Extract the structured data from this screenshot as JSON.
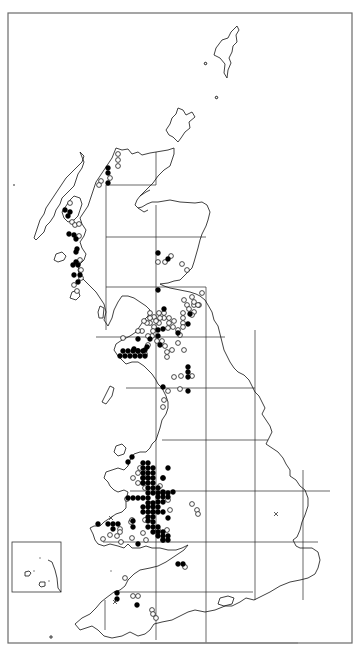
{
  "map": {
    "title": "",
    "region": "Great Britain distribution map",
    "legend": {
      "filled_circle": "record (recent)",
      "open_circle": "record (older)",
      "cross": "introduced / uncertain"
    },
    "colors": {
      "marker": "#000000",
      "background": "#ffffff",
      "frame": "#6a6a6a"
    },
    "grid_unit": "100 km square",
    "inset": "Channel Islands"
  },
  "records": {
    "filled": [
      [
        108,
        168
      ],
      [
        108,
        173
      ],
      [
        108,
        183
      ],
      [
        65,
        210
      ],
      [
        68,
        216
      ],
      [
        70,
        212
      ],
      [
        69,
        234
      ],
      [
        74,
        235
      ],
      [
        76,
        239
      ],
      [
        77,
        249
      ],
      [
        76,
        252
      ],
      [
        76,
        262
      ],
      [
        73,
        265
      ],
      [
        78,
        265
      ],
      [
        74,
        275
      ],
      [
        80,
        275
      ],
      [
        78,
        282
      ],
      [
        158,
        253
      ],
      [
        168,
        259
      ],
      [
        158,
        290
      ],
      [
        164,
        309
      ],
      [
        190,
        314
      ],
      [
        188,
        324
      ],
      [
        178,
        333
      ],
      [
        163,
        329
      ],
      [
        158,
        336
      ],
      [
        158,
        330
      ],
      [
        150,
        339
      ],
      [
        138,
        339
      ],
      [
        147,
        347
      ],
      [
        145,
        350
      ],
      [
        138,
        351
      ],
      [
        134,
        349
      ],
      [
        123,
        351
      ],
      [
        128,
        351
      ],
      [
        133,
        351
      ],
      [
        138,
        351
      ],
      [
        143,
        351
      ],
      [
        120,
        356
      ],
      [
        125,
        356
      ],
      [
        130,
        356
      ],
      [
        135,
        356
      ],
      [
        140,
        356
      ],
      [
        145,
        356
      ],
      [
        160,
        345
      ],
      [
        188,
        367
      ],
      [
        188,
        372
      ],
      [
        188,
        377
      ],
      [
        163,
        387
      ],
      [
        188,
        391
      ],
      [
        132,
        457
      ],
      [
        128,
        462
      ],
      [
        143,
        463
      ],
      [
        148,
        463
      ],
      [
        143,
        468
      ],
      [
        148,
        468
      ],
      [
        153,
        468
      ],
      [
        143,
        473
      ],
      [
        148,
        473
      ],
      [
        153,
        473
      ],
      [
        143,
        478
      ],
      [
        148,
        478
      ],
      [
        153,
        478
      ],
      [
        143,
        483
      ],
      [
        148,
        483
      ],
      [
        153,
        483
      ],
      [
        168,
        468
      ],
      [
        163,
        478
      ],
      [
        153,
        488
      ],
      [
        158,
        488
      ],
      [
        148,
        488
      ],
      [
        163,
        492
      ],
      [
        173,
        492
      ],
      [
        148,
        493
      ],
      [
        153,
        493
      ],
      [
        158,
        493
      ],
      [
        163,
        493
      ],
      [
        168,
        493
      ],
      [
        158,
        497
      ],
      [
        163,
        497
      ],
      [
        168,
        497
      ],
      [
        158,
        502
      ],
      [
        163,
        502
      ],
      [
        143,
        498
      ],
      [
        148,
        498
      ],
      [
        133,
        498
      ],
      [
        138,
        498
      ],
      [
        128,
        498
      ],
      [
        148,
        503
      ],
      [
        153,
        503
      ],
      [
        143,
        507
      ],
      [
        148,
        507
      ],
      [
        153,
        507
      ],
      [
        158,
        507
      ],
      [
        143,
        512
      ],
      [
        148,
        512
      ],
      [
        153,
        512
      ],
      [
        158,
        512
      ],
      [
        148,
        517
      ],
      [
        153,
        517
      ],
      [
        163,
        512
      ],
      [
        168,
        518
      ],
      [
        133,
        521
      ],
      [
        98,
        524
      ],
      [
        108,
        524
      ],
      [
        113,
        524
      ],
      [
        118,
        524
      ],
      [
        113,
        529
      ],
      [
        133,
        527
      ],
      [
        148,
        521
      ],
      [
        153,
        522
      ],
      [
        148,
        527
      ],
      [
        153,
        527
      ],
      [
        158,
        527
      ],
      [
        153,
        532
      ],
      [
        158,
        532
      ],
      [
        163,
        532
      ],
      [
        158,
        536
      ],
      [
        163,
        536
      ],
      [
        168,
        536
      ],
      [
        163,
        540
      ],
      [
        168,
        540
      ],
      [
        138,
        544
      ],
      [
        178,
        564
      ],
      [
        183,
        564
      ],
      [
        117,
        593
      ],
      [
        117,
        599
      ],
      [
        137,
        605
      ]
    ],
    "open": [
      [
        118,
        154
      ],
      [
        118,
        160
      ],
      [
        118,
        166
      ],
      [
        110,
        178
      ],
      [
        101,
        181
      ],
      [
        99,
        185
      ],
      [
        70,
        203
      ],
      [
        72,
        222
      ],
      [
        75,
        225
      ],
      [
        79,
        224
      ],
      [
        79,
        236
      ],
      [
        80,
        260
      ],
      [
        81,
        270
      ],
      [
        77,
        291
      ],
      [
        81,
        278
      ],
      [
        74,
        285
      ],
      [
        171,
        256
      ],
      [
        165,
        262
      ],
      [
        158,
        262
      ],
      [
        182,
        264
      ],
      [
        187,
        270
      ],
      [
        192,
        297
      ],
      [
        194,
        305
      ],
      [
        199,
        305
      ],
      [
        184,
        300
      ],
      [
        187,
        305
      ],
      [
        202,
        293
      ],
      [
        189,
        309
      ],
      [
        194,
        302
      ],
      [
        198,
        305
      ],
      [
        194,
        312
      ],
      [
        192,
        315
      ],
      [
        183,
        318
      ],
      [
        183,
        323
      ],
      [
        174,
        321
      ],
      [
        169,
        318
      ],
      [
        169,
        323
      ],
      [
        159,
        323
      ],
      [
        164,
        318
      ],
      [
        164,
        313
      ],
      [
        160,
        318
      ],
      [
        154,
        317
      ],
      [
        156,
        321
      ],
      [
        150,
        318
      ],
      [
        150,
        313
      ],
      [
        159,
        313
      ],
      [
        150,
        323
      ],
      [
        147,
        323
      ],
      [
        144,
        321
      ],
      [
        154,
        327
      ],
      [
        153,
        331
      ],
      [
        152,
        336
      ],
      [
        148,
        336
      ],
      [
        157,
        341
      ],
      [
        162,
        341
      ],
      [
        178,
        343
      ],
      [
        142,
        331
      ],
      [
        138,
        331
      ],
      [
        123,
        338
      ],
      [
        148,
        345
      ],
      [
        145,
        354
      ],
      [
        165,
        346
      ],
      [
        167,
        352
      ],
      [
        167,
        357
      ],
      [
        172,
        350
      ],
      [
        168,
        328
      ],
      [
        173,
        327
      ],
      [
        178,
        330
      ],
      [
        183,
        327
      ],
      [
        174,
        377
      ],
      [
        181,
        376
      ],
      [
        168,
        391
      ],
      [
        180,
        389
      ],
      [
        164,
        400
      ],
      [
        184,
        350
      ],
      [
        183,
        313
      ],
      [
        180,
        335
      ],
      [
        192,
        376
      ],
      [
        163,
        407
      ],
      [
        140,
        468
      ],
      [
        145,
        473
      ],
      [
        138,
        473
      ],
      [
        133,
        478
      ],
      [
        143,
        478
      ],
      [
        148,
        478
      ],
      [
        143,
        483
      ],
      [
        138,
        483
      ],
      [
        163,
        478
      ],
      [
        160,
        486
      ],
      [
        150,
        504
      ],
      [
        145,
        488
      ],
      [
        168,
        500
      ],
      [
        170,
        510
      ],
      [
        127,
        499
      ],
      [
        131,
        522
      ],
      [
        120,
        529
      ],
      [
        120,
        532
      ],
      [
        117,
        536
      ],
      [
        110,
        535
      ],
      [
        103,
        539
      ],
      [
        121,
        542
      ],
      [
        132,
        538
      ],
      [
        143,
        533
      ],
      [
        146,
        540
      ],
      [
        157,
        532
      ],
      [
        163,
        540
      ],
      [
        167,
        530
      ],
      [
        158,
        530
      ],
      [
        192,
        504
      ],
      [
        197,
        510
      ],
      [
        198,
        514
      ],
      [
        132,
        520
      ],
      [
        150,
        518
      ],
      [
        153,
        512
      ],
      [
        145,
        520
      ],
      [
        185,
        567
      ],
      [
        125,
        578
      ],
      [
        133,
        596
      ],
      [
        138,
        596
      ],
      [
        152,
        610
      ],
      [
        153,
        614
      ],
      [
        156,
        618
      ]
    ],
    "crosses": [
      [
        276,
        514
      ],
      [
        111,
        518
      ],
      [
        115,
        602
      ]
    ]
  },
  "scale_bar": {
    "label": ""
  }
}
